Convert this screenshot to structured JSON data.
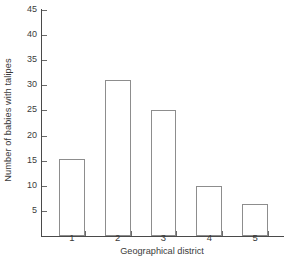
{
  "chart_data": {
    "type": "bar",
    "title": "",
    "xlabel": "Geographical district",
    "ylabel": "Number of babies with talipes",
    "categories": [
      "1",
      "2",
      "3",
      "4",
      "5"
    ],
    "values": [
      15.3,
      31,
      25,
      10,
      6.3
    ],
    "ylim": [
      0,
      45
    ],
    "yticks": [
      5,
      10,
      15,
      20,
      25,
      30,
      35,
      40,
      45
    ],
    "ytick_labels": [
      "5",
      "10",
      "15",
      "20",
      "25",
      "30",
      "35",
      "40",
      "45"
    ],
    "grid": false,
    "legend": null,
    "bar_face_color": "#ffffff",
    "bar_edge_color": "#8d8d8d",
    "axis_color": "#4a4a4a"
  }
}
